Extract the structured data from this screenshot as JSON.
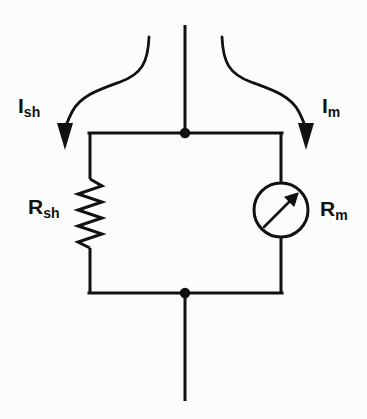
{
  "figure": {
    "background_color": "#fcfcfc",
    "stroke_color": "#111111",
    "width": 367,
    "height": 419
  },
  "labels": {
    "current_shunt": {
      "symbol": "I",
      "subscript": "sh",
      "full": "I_sh"
    },
    "current_meter": {
      "symbol": "I",
      "subscript": "m",
      "full": "I_m"
    },
    "resistor_shunt": {
      "symbol": "R",
      "subscript": "sh",
      "full": "R_sh"
    },
    "resistor_meter": {
      "symbol": "R",
      "subscript": "m",
      "full": "R_m"
    }
  },
  "components": {
    "resistor": {
      "name": "shunt-resistor",
      "type": "zigzag-resistor",
      "label": "R_sh",
      "branch": "left"
    },
    "meter": {
      "name": "meter-movement",
      "type": "circle-needle-meter",
      "label": "R_m",
      "branch": "right",
      "needle_direction": "up-right"
    },
    "nodes": [
      {
        "name": "top-junction",
        "x": 185,
        "y": 133
      },
      {
        "name": "bottom-junction",
        "x": 185,
        "y": 293
      }
    ],
    "arrows": [
      {
        "name": "current-arrow-shunt",
        "label": "I_sh",
        "side": "left",
        "direction": "down"
      },
      {
        "name": "current-arrow-meter",
        "label": "I_m",
        "side": "right",
        "direction": "down"
      }
    ],
    "terminals": [
      {
        "name": "top-terminal-lead",
        "orientation": "vertical"
      },
      {
        "name": "bottom-terminal-lead",
        "orientation": "vertical"
      }
    ]
  }
}
